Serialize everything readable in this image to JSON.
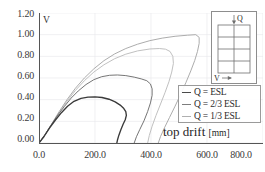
{
  "chart_data": {
    "type": "line",
    "title": "",
    "xlabel": "top drift",
    "xunit": "[mm]",
    "ylabel": "V",
    "xlim": [
      0.0,
      800.0
    ],
    "ylim": [
      0.0,
      1.2
    ],
    "grid": true,
    "xticks": [
      "0.0",
      "200.0",
      "400.0",
      "600.0",
      "800.0"
    ],
    "xtick_values": [
      0,
      200,
      400,
      600,
      800
    ],
    "yticks": [
      "0.00",
      "0.20",
      "0.40",
      "0.60",
      "0.80",
      "1.00",
      "1.20"
    ],
    "ytick_values": [
      0,
      0.2,
      0.4,
      0.6,
      0.8,
      1.0,
      1.2
    ],
    "legend_position": "right-middle",
    "series": [
      {
        "name": "Q = ESL",
        "color": "#3a3a3a",
        "points": [
          [
            0,
            0
          ],
          [
            18,
            0.06
          ],
          [
            38,
            0.14
          ],
          [
            58,
            0.21
          ],
          [
            80,
            0.28
          ],
          [
            102,
            0.34
          ],
          [
            125,
            0.385
          ],
          [
            150,
            0.412
          ],
          [
            175,
            0.424
          ],
          [
            200,
            0.426
          ],
          [
            225,
            0.42
          ],
          [
            250,
            0.404
          ],
          [
            272,
            0.38
          ],
          [
            290,
            0.35
          ],
          [
            303,
            0.318
          ],
          [
            310,
            0.29
          ],
          [
            312,
            0.255
          ],
          [
            308,
            0.215
          ],
          [
            300,
            0.17
          ],
          [
            292,
            0.12
          ],
          [
            285,
            0.07
          ],
          [
            280,
            0.025
          ],
          [
            278,
            0.0
          ]
        ]
      },
      {
        "name": "Q = 2/3 ESL",
        "color": "#6e6e6e",
        "points": [
          [
            0,
            0
          ],
          [
            20,
            0.07
          ],
          [
            42,
            0.16
          ],
          [
            65,
            0.25
          ],
          [
            90,
            0.335
          ],
          [
            115,
            0.415
          ],
          [
            140,
            0.48
          ],
          [
            168,
            0.54
          ],
          [
            196,
            0.585
          ],
          [
            224,
            0.612
          ],
          [
            252,
            0.625
          ],
          [
            280,
            0.628
          ],
          [
            310,
            0.622
          ],
          [
            340,
            0.608
          ],
          [
            365,
            0.592
          ],
          [
            385,
            0.575
          ],
          [
            398,
            0.545
          ],
          [
            404,
            0.5
          ],
          [
            404,
            0.44
          ],
          [
            398,
            0.37
          ],
          [
            388,
            0.29
          ],
          [
            375,
            0.205
          ],
          [
            360,
            0.125
          ],
          [
            348,
            0.058
          ],
          [
            340,
            0.0
          ]
        ]
      },
      {
        "name": "Q = 1/3 ESL",
        "color": "#a8a8a8",
        "points": [
          [
            0,
            0
          ],
          [
            22,
            0.08
          ],
          [
            46,
            0.18
          ],
          [
            72,
            0.29
          ],
          [
            100,
            0.4
          ],
          [
            130,
            0.505
          ],
          [
            162,
            0.6
          ],
          [
            196,
            0.685
          ],
          [
            232,
            0.76
          ],
          [
            270,
            0.822
          ],
          [
            310,
            0.872
          ],
          [
            352,
            0.912
          ],
          [
            396,
            0.945
          ],
          [
            440,
            0.968
          ],
          [
            486,
            0.985
          ],
          [
            530,
            0.995
          ],
          [
            560,
            1.0
          ],
          [
            572,
            0.975
          ],
          [
            572,
            0.92
          ],
          [
            566,
            0.845
          ],
          [
            556,
            0.76
          ],
          [
            542,
            0.665
          ],
          [
            525,
            0.56
          ],
          [
            506,
            0.45
          ],
          [
            486,
            0.34
          ],
          [
            466,
            0.235
          ],
          [
            448,
            0.14
          ],
          [
            434,
            0.06
          ],
          [
            426,
            0.0
          ]
        ]
      },
      {
        "name": "Q = 1/3 ESL inner",
        "color": "#bdbdbd",
        "points": [
          [
            0,
            0
          ],
          [
            22,
            0.08
          ],
          [
            46,
            0.175
          ],
          [
            72,
            0.28
          ],
          [
            100,
            0.385
          ],
          [
            130,
            0.485
          ],
          [
            162,
            0.575
          ],
          [
            196,
            0.655
          ],
          [
            232,
            0.722
          ],
          [
            270,
            0.778
          ],
          [
            310,
            0.82
          ],
          [
            352,
            0.85
          ],
          [
            396,
            0.868
          ],
          [
            430,
            0.872
          ],
          [
            452,
            0.866
          ],
          [
            468,
            0.845
          ],
          [
            478,
            0.8
          ],
          [
            480,
            0.735
          ],
          [
            474,
            0.655
          ],
          [
            464,
            0.565
          ],
          [
            450,
            0.465
          ],
          [
            434,
            0.36
          ],
          [
            418,
            0.255
          ],
          [
            404,
            0.155
          ],
          [
            394,
            0.07
          ],
          [
            388,
            0.0
          ]
        ]
      }
    ]
  },
  "axis": {
    "ylabel_inside": "V"
  },
  "legend": {
    "items": [
      {
        "label": "Q = ESL",
        "color": "#4a4a4a"
      },
      {
        "label": "Q = 2/3 ESL",
        "color": "#7d7d7d"
      },
      {
        "label": "Q = 1/3 ESL",
        "color": "#b0b0b0"
      }
    ]
  },
  "inset": {
    "load_label": "Q",
    "drift_label": "V",
    "bays": 2,
    "stories": 4
  }
}
